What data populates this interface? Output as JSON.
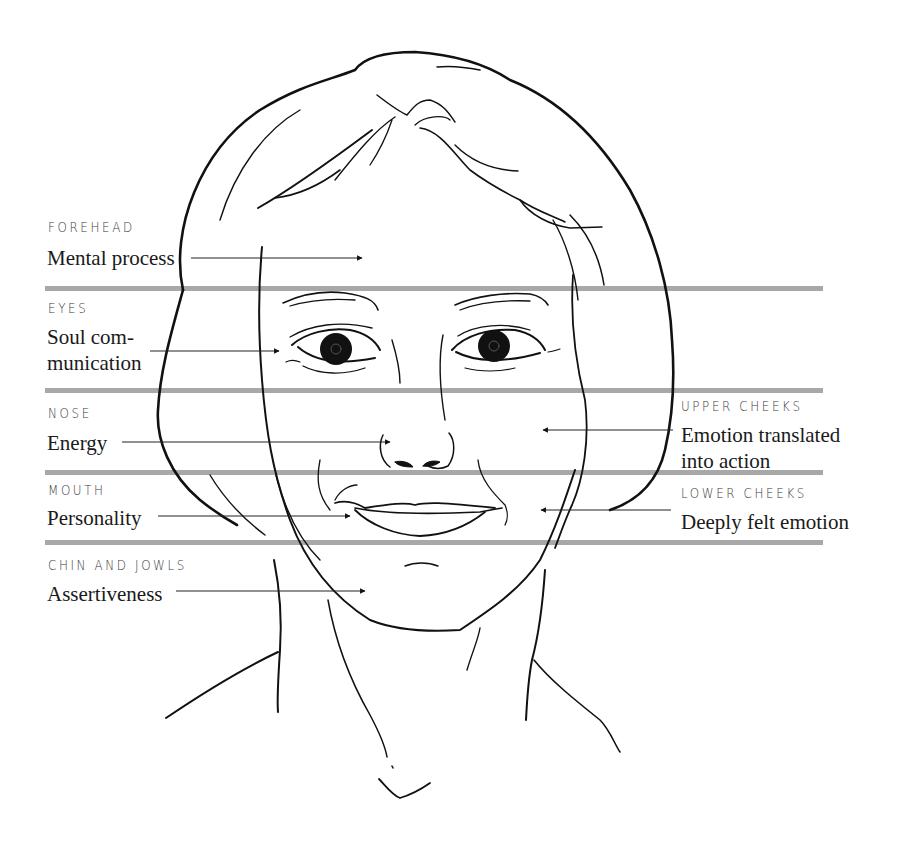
{
  "diagram": {
    "divider_color": "#a8a8a8",
    "ink_color": "#111111",
    "regions": [
      {
        "id": "forehead",
        "title": "FOREHEAD",
        "lines": [
          "Mental process"
        ]
      },
      {
        "id": "eyes",
        "title": "EYES",
        "lines": [
          "Soul com-",
          "munication"
        ]
      },
      {
        "id": "nose",
        "title": "NOSE",
        "lines": [
          "Energy"
        ]
      },
      {
        "id": "mouth",
        "title": "MOUTH",
        "lines": [
          "Personality"
        ]
      },
      {
        "id": "chin",
        "title": "CHIN AND JOWLS",
        "lines": [
          "Assertiveness"
        ]
      },
      {
        "id": "upper-cheeks",
        "title": "UPPER CHEEKS",
        "lines": [
          "Emotion translated",
          "into action"
        ]
      },
      {
        "id": "lower-cheeks",
        "title": "LOWER CHEEKS",
        "lines": [
          "Deeply felt emotion"
        ]
      }
    ]
  }
}
